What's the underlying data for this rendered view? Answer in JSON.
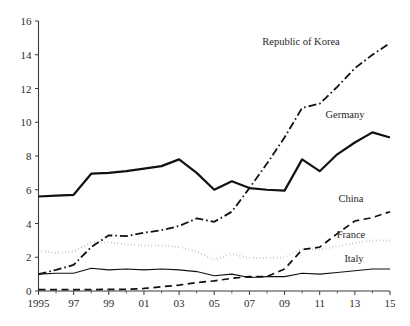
{
  "chart_data": {
    "type": "line",
    "title": "",
    "subtitle": "",
    "xlabel": "",
    "ylabel": "",
    "xlim": [
      1995,
      2015
    ],
    "ylim": [
      0,
      16
    ],
    "grid": false,
    "legend_position": "inline-right-labels",
    "x": [
      1995,
      1996,
      1997,
      1998,
      1999,
      2000,
      2001,
      2002,
      2003,
      2004,
      2005,
      2006,
      2007,
      2008,
      2009,
      2010,
      2011,
      2012,
      2013,
      2014,
      2015
    ],
    "x_tick_labels": [
      "1995",
      "97",
      "99",
      "01",
      "03",
      "05",
      "07",
      "09",
      "11",
      "13",
      "15"
    ],
    "x_tick_values": [
      1995,
      1997,
      1999,
      2001,
      2003,
      2005,
      2007,
      2009,
      2011,
      2013,
      2015
    ],
    "y_tick_labels": [
      "0",
      "2",
      "4",
      "6",
      "8",
      "10",
      "12",
      "14",
      "16"
    ],
    "y_tick_values": [
      0,
      2,
      4,
      6,
      8,
      10,
      12,
      14,
      16
    ],
    "series": [
      {
        "name": "Republic of Korea",
        "label": "Republic of Korea",
        "style": "dash-dot",
        "color": "#111111",
        "width": 1.8,
        "label_x": 301,
        "label_y": 45,
        "values": [
          1.0,
          1.25,
          1.55,
          2.6,
          3.3,
          3.25,
          3.45,
          3.6,
          3.85,
          4.3,
          4.1,
          4.7,
          6.1,
          7.55,
          9.1,
          10.85,
          11.1,
          12.1,
          13.2,
          14.0,
          14.7
        ]
      },
      {
        "name": "Germany",
        "label": "Germany",
        "style": "solid-thick",
        "color": "#111111",
        "width": 2.2,
        "label_x": 345,
        "label_y": 118,
        "values": [
          5.6,
          5.65,
          5.7,
          6.95,
          7.0,
          7.1,
          7.25,
          7.4,
          7.8,
          7.0,
          6.0,
          6.5,
          6.1,
          6.0,
          5.95,
          7.8,
          7.1,
          8.1,
          8.8,
          9.4,
          9.1
        ]
      },
      {
        "name": "China",
        "label": "China",
        "style": "dashed",
        "color": "#111111",
        "width": 1.7,
        "label_x": 351,
        "label_y": 202,
        "values": [
          0.08,
          0.08,
          0.08,
          0.08,
          0.1,
          0.1,
          0.15,
          0.25,
          0.35,
          0.5,
          0.6,
          0.75,
          0.85,
          0.85,
          1.3,
          2.45,
          2.6,
          3.4,
          4.15,
          4.35,
          4.7
        ]
      },
      {
        "name": "France",
        "label": "France",
        "style": "dotted",
        "color": "#111111",
        "width": 2.0,
        "label_x": 351,
        "label_y": 238,
        "values": [
          2.4,
          2.25,
          2.35,
          2.85,
          2.9,
          2.75,
          2.7,
          2.7,
          2.6,
          2.35,
          1.85,
          2.2,
          1.95,
          1.95,
          2.0,
          2.5,
          2.45,
          2.65,
          2.85,
          3.0,
          3.0
        ]
      },
      {
        "name": "Italy",
        "label": "Italy",
        "style": "solid-thin",
        "color": "#6f6f6f",
        "width": 1.1,
        "label_x": 354,
        "label_y": 262,
        "values": [
          1.0,
          1.05,
          1.05,
          1.35,
          1.25,
          1.3,
          1.25,
          1.3,
          1.25,
          1.15,
          0.9,
          1.0,
          0.8,
          0.85,
          0.85,
          1.05,
          1.0,
          1.1,
          1.2,
          1.3,
          1.3
        ]
      }
    ]
  },
  "axes": {
    "y_axis_name": "value-axis",
    "x_axis_name": "year-axis"
  }
}
